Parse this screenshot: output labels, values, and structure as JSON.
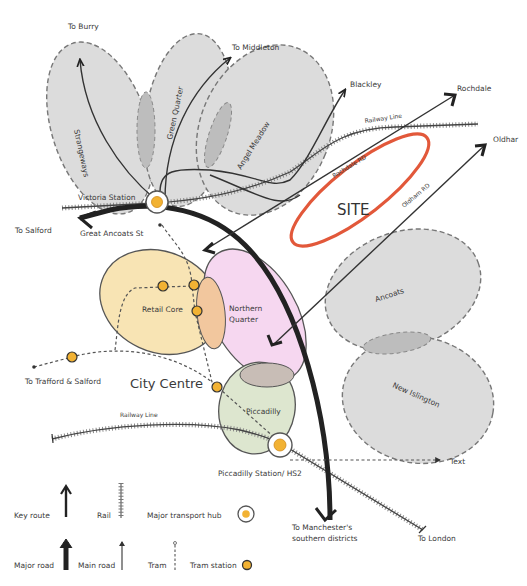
{
  "destinations": {
    "bury": "To Burry",
    "middleton": "To Middleton",
    "blackley": "Blackley",
    "rochdale": "Rochdale",
    "oldham": "Oldhar",
    "salford": "To Salford",
    "trafford_salford": "To Trafford & Salford",
    "southern": [
      "To Manchester's",
      "southern districts"
    ],
    "london": "To London",
    "text_placeholder": "Text"
  },
  "zones": {
    "strangeways": "Strangeways",
    "green_quarter": "Green Quarter",
    "angel_meadow": "Angel Meadow",
    "ancoats": "Ancoats",
    "new_islington": "New Islington",
    "retail_core": "Retail Core",
    "northern_quarter": [
      "Northern",
      "Quarter"
    ],
    "piccadilly": "Piccadilly",
    "site": "SITE",
    "city_centre": "City Centre"
  },
  "roads": {
    "rochdale_rd": "Rochdale RD",
    "oldham_rd": "Oldham RD",
    "great_ancoats_st": "Great Ancoats St",
    "railway_line_north": "Railway Line",
    "railway_line_south": "Railway Line"
  },
  "stations": {
    "victoria": "Victoria Station",
    "piccadilly": "Piccadilly Station/ HS2"
  },
  "legend": {
    "key_route": "Key route",
    "rail": "Rail",
    "major_transport_hub": "Major transport hub",
    "major_road": "Major road",
    "main_road": "Main road",
    "tram": "Tram",
    "tram_station": "Tram station"
  },
  "colors": {
    "site_outline": "#e2583a",
    "zone_grey": "#dcdcdc",
    "retail_core": "#f8e4b4",
    "northern_quarter": "#f5d3ee",
    "piccadilly": "#dde6cf",
    "tram_station": "#f2b233",
    "road_dark": "#222222"
  }
}
